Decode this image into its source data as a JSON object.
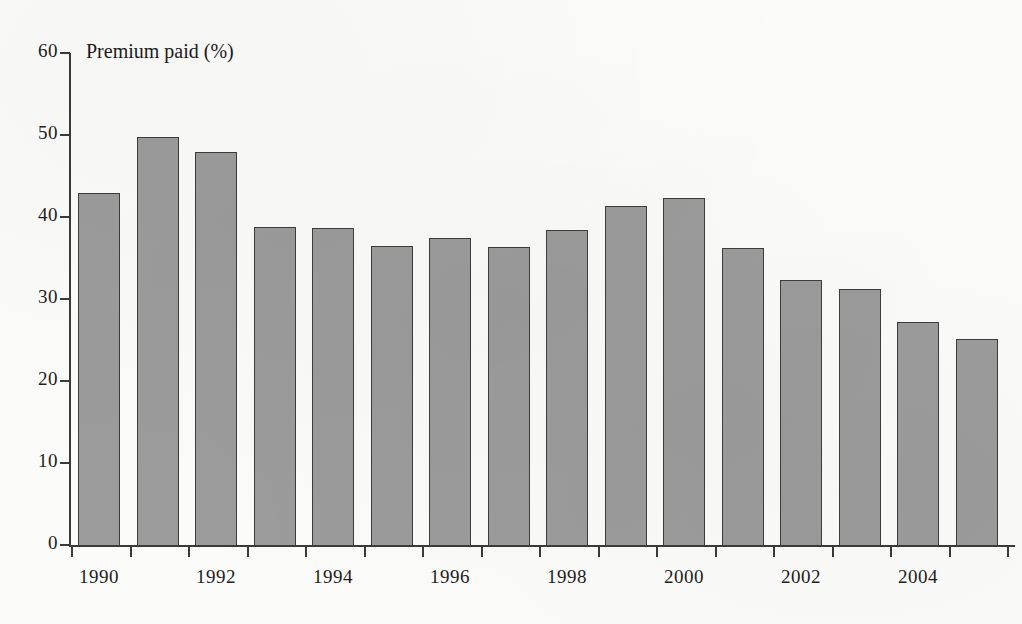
{
  "chart_data": {
    "type": "bar",
    "title": "Premium paid (%)",
    "xlabel": "",
    "ylabel": "Premium paid (%)",
    "ylim": [
      0,
      60
    ],
    "yticks": [
      0,
      10,
      20,
      30,
      40,
      50,
      60
    ],
    "grid": false,
    "legend": null,
    "categories": [
      "1990",
      "1991",
      "1992",
      "1993",
      "1994",
      "1995",
      "1996",
      "1997",
      "1998",
      "1999",
      "2000",
      "2001",
      "2002",
      "2003",
      "2004",
      "2005"
    ],
    "xtick_labels": [
      "1990",
      "1992",
      "1994",
      "1996",
      "1998",
      "2000",
      "2002",
      "2004"
    ],
    "values": [
      42.9,
      49.8,
      47.9,
      38.8,
      38.7,
      36.5,
      37.5,
      36.4,
      38.4,
      41.4,
      42.3,
      36.2,
      32.3,
      31.2,
      27.2,
      25.1
    ],
    "bar_color": "#9b9b9b",
    "bar_edge_color": "#3c3c3c",
    "axis_color": "#3a3a3a",
    "background_color": "#fbfbf9"
  }
}
